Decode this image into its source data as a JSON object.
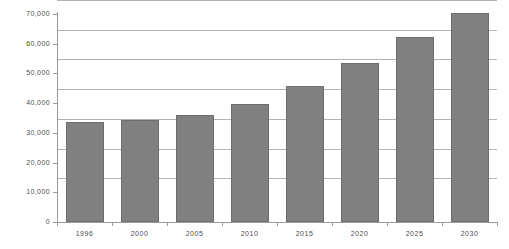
{
  "chart_data": {
    "type": "bar",
    "title": "",
    "subtitle": "",
    "xlabel": "",
    "ylabel": "",
    "categories": [
      "1996",
      "2000",
      "2005",
      "2010",
      "2015",
      "2020",
      "2025",
      "2030"
    ],
    "values": [
      33700,
      34400,
      36100,
      39600,
      45800,
      53400,
      62200,
      70200
    ],
    "series": [
      {
        "name": "Value",
        "values": [
          33700,
          34400,
          36100,
          39600,
          45800,
          53400,
          62200,
          70200
        ],
        "color": "#808080"
      }
    ],
    "ylim": [
      0,
      70000
    ],
    "ytick_values": [
      0,
      10000,
      20000,
      30000,
      40000,
      50000,
      60000,
      70000
    ],
    "ytick_labels": [
      "0",
      "10,000",
      "20,000",
      "30,000",
      "40,000",
      "50,000",
      "60,000",
      "70,000"
    ],
    "grid": true,
    "grid_axis": "y",
    "legend": false,
    "legend_position": "none",
    "bar_color": "#808080",
    "bar_border_color": "#6e6e6e",
    "gridline_color": "#b3b3b3",
    "axis_color": "#9a9a9a",
    "background_color": "#ffffff",
    "tick_label_color": "#4d4d4d"
  }
}
